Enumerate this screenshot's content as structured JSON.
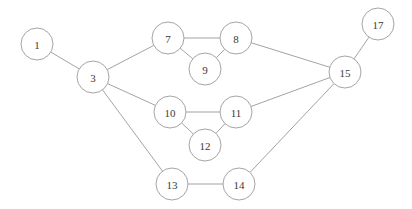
{
  "chart_data": {
    "type": "diagram",
    "title": "",
    "subtitle": "",
    "xlabel": "",
    "ylabel": "",
    "graph_kind": "undirected-node-link-graph",
    "layout_hints": {
      "grid": false,
      "legend": "none",
      "axes": "none",
      "canvas_width": 412,
      "canvas_height": 209,
      "background_color": "#ffffff"
    },
    "style": {
      "node_fill": "#ffffff",
      "node_stroke": "#9a9a9a",
      "node_radius": 16,
      "edge_color": "#8c8c8c",
      "edge_width": 0.8,
      "label_color": "#3a3a3a",
      "label_size": 11
    },
    "nodes": [
      {
        "id": "1",
        "label": "1",
        "x": 37,
        "y": 44,
        "r": 16
      },
      {
        "id": "3",
        "label": "3",
        "x": 93,
        "y": 77,
        "r": 16
      },
      {
        "id": "7",
        "label": "7",
        "x": 168,
        "y": 38,
        "r": 16
      },
      {
        "id": "8",
        "label": "8",
        "x": 236,
        "y": 38,
        "r": 16
      },
      {
        "id": "9",
        "label": "9",
        "x": 205,
        "y": 69,
        "r": 16
      },
      {
        "id": "10",
        "label": "10",
        "x": 170,
        "y": 112,
        "r": 16
      },
      {
        "id": "11",
        "label": "11",
        "x": 236,
        "y": 112,
        "r": 16
      },
      {
        "id": "12",
        "label": "12",
        "x": 205,
        "y": 145,
        "r": 16
      },
      {
        "id": "13",
        "label": "13",
        "x": 172,
        "y": 184,
        "r": 16
      },
      {
        "id": "14",
        "label": "14",
        "x": 239,
        "y": 184,
        "r": 16
      },
      {
        "id": "15",
        "label": "15",
        "x": 345,
        "y": 72,
        "r": 16
      },
      {
        "id": "17",
        "label": "17",
        "x": 378,
        "y": 24,
        "r": 16
      }
    ],
    "edges": [
      {
        "source": "1",
        "target": "3"
      },
      {
        "source": "3",
        "target": "7"
      },
      {
        "source": "3",
        "target": "10"
      },
      {
        "source": "3",
        "target": "13"
      },
      {
        "source": "7",
        "target": "8"
      },
      {
        "source": "7",
        "target": "9"
      },
      {
        "source": "8",
        "target": "9"
      },
      {
        "source": "8",
        "target": "15"
      },
      {
        "source": "10",
        "target": "11"
      },
      {
        "source": "10",
        "target": "12"
      },
      {
        "source": "11",
        "target": "12"
      },
      {
        "source": "11",
        "target": "15"
      },
      {
        "source": "13",
        "target": "14"
      },
      {
        "source": "14",
        "target": "15"
      },
      {
        "source": "15",
        "target": "17"
      }
    ]
  }
}
